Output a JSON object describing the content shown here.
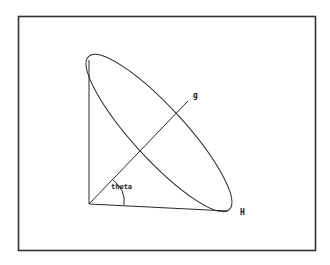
{
  "diagram": {
    "labels": {
      "vertical_axis": "g",
      "horizontal_axis": "H",
      "angle": "theta"
    },
    "colors": {
      "stroke": "#2a2a2a",
      "frame": "#333333",
      "background": "#ffffff"
    }
  }
}
